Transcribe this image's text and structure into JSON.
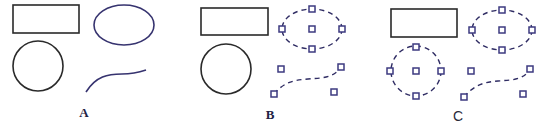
{
  "figure": {
    "panels": [
      {
        "id": "A",
        "label": "A",
        "label_pos": [
          84,
          117
        ],
        "state": "unselected",
        "shapes": {
          "rectangle": {
            "x": 13,
            "y": 5,
            "w": 66,
            "h": 28,
            "color": "#2a2a2a"
          },
          "circle": {
            "cx": 38,
            "cy": 66,
            "r": 25,
            "color": "#2a2a2a"
          },
          "ellipse": {
            "cx": 124,
            "cy": 25,
            "rx": 30,
            "ry": 20,
            "color": "#36336f"
          },
          "curve": {
            "d": "M86,92 C96,76 108,74 122,74 C134,74 140,72 146,70",
            "color": "#36336f"
          }
        }
      },
      {
        "id": "B",
        "label": "B",
        "label_pos": [
          270,
          119
        ],
        "state": "ellipse and curve selected",
        "shapes": {
          "rectangle": {
            "x": 201,
            "y": 8,
            "w": 67,
            "h": 27,
            "color": "#2a2a2a"
          },
          "circle": {
            "cx": 226,
            "cy": 69,
            "r": 25,
            "color": "#2a2a2a"
          },
          "ellipse": {
            "cx": 312,
            "cy": 29,
            "rx": 30,
            "ry": 20,
            "dashed": true,
            "handles": [
              [
                312,
                9
              ],
              [
                282,
                29
              ],
              [
                342,
                29
              ],
              [
                312,
                49
              ],
              [
                312,
                29
              ]
            ]
          },
          "curve": {
            "d": "M274,94 C284,82 294,80 308,79 C322,78 334,78 341,67",
            "dashed": true,
            "handles": [
              [
                274,
                94
              ],
              [
                341,
                67
              ],
              [
                281,
                69
              ],
              [
                334,
                92
              ]
            ]
          }
        }
      },
      {
        "id": "C",
        "label": "C",
        "label_pos": [
          458,
          121
        ],
        "state": "circle, ellipse and curve selected",
        "shapes": {
          "rectangle": {
            "x": 391,
            "y": 9,
            "w": 66,
            "h": 28,
            "color": "#2a2a2a"
          },
          "circle": {
            "cx": 416,
            "cy": 71,
            "r": 25,
            "dashed": true,
            "handles": [
              [
                416,
                47
              ],
              [
                390,
                71
              ],
              [
                441,
                71
              ],
              [
                416,
                96
              ],
              [
                416,
                71
              ]
            ]
          },
          "ellipse": {
            "cx": 502,
            "cy": 30,
            "rx": 30,
            "ry": 20,
            "dashed": true,
            "handles": [
              [
                502,
                10
              ],
              [
                472,
                30
              ],
              [
                532,
                30
              ],
              [
                502,
                50
              ],
              [
                502,
                30
              ]
            ]
          },
          "curve": {
            "d": "M464,97 C474,85 484,82 498,81 C512,80 524,80 530,69",
            "dashed": true,
            "handles": [
              [
                464,
                97
              ],
              [
                530,
                69
              ],
              [
                471,
                71
              ],
              [
                523,
                94
              ]
            ]
          }
        }
      }
    ],
    "colors": {
      "outline_black": "#2a2a2a",
      "outline_blue": "#36336f",
      "handle": "#3d3a80",
      "background": "#ffffff"
    }
  }
}
